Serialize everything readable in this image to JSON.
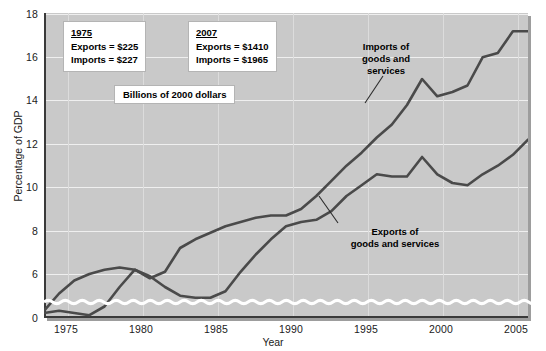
{
  "chart_data": {
    "type": "line",
    "title": "",
    "xlabel": "Year",
    "ylabel": "Percentage of GDP",
    "xlim": [
      1975,
      2007
    ],
    "ylim": [
      0,
      18
    ],
    "y_axis_break": true,
    "y_break_note": "axis broken between 0 and 6",
    "grid": true,
    "legend_position": "inline-annotations",
    "xticks": [
      1975,
      1980,
      1985,
      1990,
      1995,
      2000,
      2005
    ],
    "yticks": [
      0,
      6,
      8,
      10,
      12,
      14,
      16,
      18
    ],
    "x": [
      1975,
      1976,
      1977,
      1978,
      1979,
      1980,
      1981,
      1982,
      1983,
      1984,
      1985,
      1986,
      1987,
      1988,
      1989,
      1990,
      1991,
      1992,
      1993,
      1994,
      1995,
      1996,
      1997,
      1998,
      1999,
      2000,
      2001,
      2002,
      2003,
      2004,
      2005,
      2006,
      2007
    ],
    "series": [
      {
        "name": "Exports of goods and services",
        "color": "#4a4a4a",
        "values": [
          8.4,
          8.2,
          7.8,
          8.1,
          8.8,
          9.8,
          9.6,
          8.9,
          8.0,
          7.6,
          7.2,
          7.4,
          7.8,
          8.8,
          9.4,
          9.6,
          10.0,
          10.1,
          10.0,
          10.3,
          11.0,
          11.1,
          11.6,
          11.2,
          10.9,
          11.6,
          10.5,
          10.0,
          10.0,
          10.5,
          11.0,
          11.5,
          12.2
        ]
      },
      {
        "name": "Imports of goods and services",
        "color": "#4a4a4a",
        "values": [
          7.4,
          8.3,
          9.0,
          9.3,
          9.7,
          10.3,
          10.2,
          9.7,
          9.5,
          10.5,
          10.5,
          10.7,
          11.1,
          11.3,
          11.4,
          11.5,
          11.2,
          11.3,
          11.6,
          12.3,
          12.8,
          13.2,
          13.8,
          14.1,
          15.0,
          16.1,
          15.1,
          15.3,
          15.8,
          17.0,
          17.5,
          18.2,
          18.1
        ],
        "note": "displayed positions follow the drawn curve"
      }
    ],
    "drawn_points": {
      "exports": [
        [
          1975,
          4.2
        ],
        [
          1976,
          4.3
        ],
        [
          1977,
          4.2
        ],
        [
          1978,
          4.1
        ],
        [
          1979,
          4.5
        ],
        [
          1980,
          5.4
        ],
        [
          1981,
          6.2
        ],
        [
          1982,
          5.9
        ],
        [
          1983,
          5.4
        ],
        [
          1984,
          5.0
        ],
        [
          1985,
          4.9
        ],
        [
          1986,
          4.9
        ],
        [
          1987,
          5.2
        ],
        [
          1988,
          6.1
        ],
        [
          1989,
          6.9
        ],
        [
          1990,
          7.6
        ],
        [
          1991,
          8.2
        ],
        [
          1992,
          8.4
        ],
        [
          1993,
          8.5
        ],
        [
          1994,
          8.9
        ],
        [
          1995,
          9.6
        ],
        [
          1996,
          10.1
        ],
        [
          1997,
          10.6
        ],
        [
          1998,
          10.5
        ],
        [
          1999,
          10.5
        ],
        [
          2000,
          11.4
        ],
        [
          2001,
          10.6
        ],
        [
          2002,
          10.2
        ],
        [
          2003,
          10.1
        ],
        [
          2004,
          10.6
        ],
        [
          2005,
          11.0
        ],
        [
          2006,
          11.5
        ],
        [
          2007,
          12.2
        ]
      ],
      "imports": [
        [
          1975,
          4.3
        ],
        [
          1976,
          5.1
        ],
        [
          1977,
          5.7
        ],
        [
          1978,
          6.0
        ],
        [
          1979,
          6.2
        ],
        [
          1980,
          6.3
        ],
        [
          1981,
          6.2
        ],
        [
          1982,
          5.8
        ],
        [
          1983,
          6.1
        ],
        [
          1984,
          7.2
        ],
        [
          1985,
          7.6
        ],
        [
          1986,
          7.9
        ],
        [
          1987,
          8.2
        ],
        [
          1988,
          8.4
        ],
        [
          1989,
          8.6
        ],
        [
          1990,
          8.7
        ],
        [
          1991,
          8.7
        ],
        [
          1992,
          9.0
        ],
        [
          1993,
          9.6
        ],
        [
          1994,
          10.3
        ],
        [
          1995,
          11.0
        ],
        [
          1996,
          11.6
        ],
        [
          1997,
          12.3
        ],
        [
          1998,
          12.9
        ],
        [
          1999,
          13.8
        ],
        [
          2000,
          15.0
        ],
        [
          2001,
          14.2
        ],
        [
          2002,
          14.4
        ],
        [
          2003,
          14.7
        ],
        [
          2004,
          16.0
        ],
        [
          2005,
          16.2
        ],
        [
          2006,
          17.2
        ],
        [
          2007,
          17.2
        ]
      ]
    },
    "annotations": [
      {
        "id": "box-1975",
        "year_label": "1975",
        "lines": [
          "Exports  =  $225",
          "Imports  =  $227"
        ]
      },
      {
        "id": "box-2007",
        "year_label": "2007",
        "lines": [
          "Exports  =  $1410",
          "Imports  =  $1965"
        ]
      }
    ],
    "units_note": "Billions of 2000 dollars",
    "series_callouts": [
      {
        "id": "imports-callout",
        "text_lines": [
          "Imports of",
          "goods and",
          "services"
        ]
      },
      {
        "id": "exports-callout",
        "text_lines": [
          "Exports of",
          "goods and services"
        ]
      }
    ]
  },
  "ticks": {
    "y": [
      "18",
      "16",
      "14",
      "12",
      "10",
      "8",
      "6",
      "0"
    ],
    "x": [
      "1975",
      "1980",
      "1985",
      "1990",
      "1995",
      "2000",
      "2005"
    ]
  },
  "labels": {
    "x_axis_title": "Year",
    "y_axis_title": "Percentage of GDP",
    "units_note": "Billions of 2000 dollars",
    "box1_year": "1975",
    "box1_exports": "Exports  =  $225",
    "box1_imports": "Imports  =  $227",
    "box2_year": "2007",
    "box2_exports": "Exports  =  $1410",
    "box2_imports": "Imports  =  $1965",
    "imports_l1": "Imports of",
    "imports_l2": "goods and",
    "imports_l3": "services",
    "exports_l1": "Exports of",
    "exports_l2": "goods and services"
  },
  "colors": {
    "plot_background": "#c9c9c9",
    "gridline": "#efefef",
    "line": "#4a4a4a",
    "axis": "#3a3a3a",
    "text": "#1b1b1b",
    "box_background": "#ffffff"
  }
}
